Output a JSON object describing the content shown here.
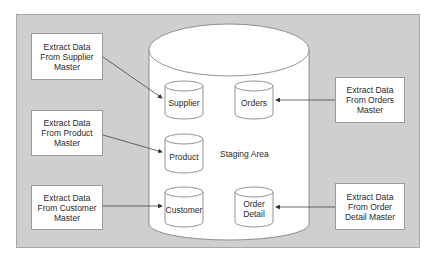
{
  "diagram": {
    "staging_area": {
      "label": "Staging Area"
    },
    "sources": [
      {
        "id": "supplier",
        "label": "Extract Data From Supplier Master"
      },
      {
        "id": "product",
        "label": "Extract Data From Product Master"
      },
      {
        "id": "customer",
        "label": "Extract Data From Customer Master"
      },
      {
        "id": "orders",
        "label": "Extract Data From Orders Master"
      },
      {
        "id": "order_detail",
        "label": "Extract Data From Order Detail Master"
      }
    ],
    "tables": [
      {
        "id": "supplier",
        "label": "Supplier"
      },
      {
        "id": "product",
        "label": "Product"
      },
      {
        "id": "customer",
        "label": "Customer"
      },
      {
        "id": "orders",
        "label": "Orders"
      },
      {
        "id": "order_detail",
        "label": "Order Detail"
      }
    ],
    "edges": [
      {
        "from": "Extract Data From Supplier Master",
        "to": "Supplier"
      },
      {
        "from": "Extract Data From Product Master",
        "to": "Product"
      },
      {
        "from": "Extract Data From Customer Master",
        "to": "Customer"
      },
      {
        "from": "Extract Data From Orders Master",
        "to": "Orders"
      },
      {
        "from": "Extract Data From Order Detail Master",
        "to": "Order Detail"
      }
    ],
    "colors": {
      "background": "#cfcfcf",
      "box": "#ffffff",
      "stroke": "#555555"
    }
  }
}
